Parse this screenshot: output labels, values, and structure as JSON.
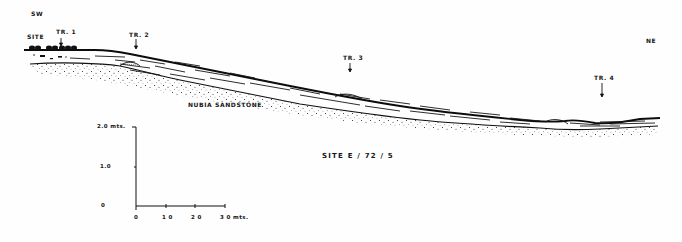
{
  "diagram": {
    "title": "SITE  E / 72 / 5",
    "orientation": {
      "left": "SW",
      "right": "NE"
    },
    "labels": {
      "site": "SITE",
      "formation": "NUBIA SANDSTONE"
    },
    "trenches": [
      {
        "label": "TR. 1"
      },
      {
        "label": "TR. 2"
      },
      {
        "label": "TR. 3"
      },
      {
        "label": "TR. 4"
      }
    ],
    "scale": {
      "vertical_ticks": [
        "2.0 mts.",
        "1.0",
        "0"
      ],
      "horizontal_ticks": [
        "0",
        "1 0",
        "2 0",
        "3 0 mts."
      ]
    },
    "colors": {
      "ink": "#111111",
      "paper": "#fefefe"
    }
  }
}
